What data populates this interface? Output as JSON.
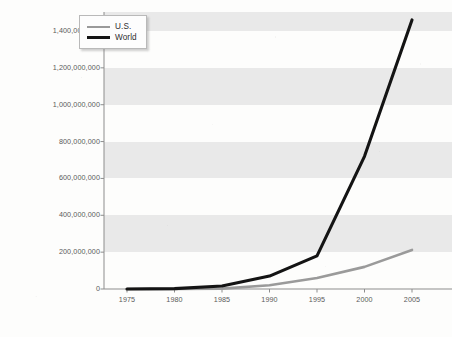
{
  "chart_data": {
    "type": "line",
    "title": "",
    "subtitle": "",
    "xlabel": "",
    "ylabel": "",
    "x": [
      1975,
      1980,
      1985,
      1990,
      1995,
      2000,
      2005
    ],
    "categories": [
      "1975",
      "1980",
      "1985",
      "1990",
      "1995",
      "2000",
      "2005"
    ],
    "xlim": [
      1975,
      2005
    ],
    "ylim": [
      0,
      1400000000
    ],
    "grid": false,
    "banded_background": true,
    "legend_position": "top-left-inside",
    "series": [
      {
        "name": "U.S.",
        "color": "#9a9a9a",
        "values": [
          0,
          0,
          2000000,
          20000000,
          60000000,
          120000000,
          212000000
        ]
      },
      {
        "name": "World",
        "color": "#141414",
        "values": [
          0,
          2000000,
          16000000,
          70000000,
          180000000,
          720000000,
          1460000000
        ]
      }
    ],
    "yticks": [
      0,
      200000000,
      400000000,
      600000000,
      800000000,
      1000000000,
      1200000000,
      1400000000
    ],
    "ytick_labels": [
      "0",
      "200,000,000",
      "400,000,000",
      "600,000,000",
      "800,000,000",
      "1,000,000,000",
      "1,200,000,000",
      "1,400,000,000"
    ],
    "xtick_labels": [
      "1975",
      "1980",
      "1985",
      "1990",
      "1995",
      "2000",
      "2005"
    ]
  },
  "legend": {
    "items": [
      {
        "label": "U.S.",
        "color": "#9a9a9a"
      },
      {
        "label": "World",
        "color": "#141414"
      }
    ]
  },
  "colors": {
    "us_line": "#9a9a9a",
    "world_line": "#141414",
    "band": "#e9e9e9",
    "axis": "#8d8d8d",
    "paper": "#fdfdfc",
    "tick_text": "#5a5a5a"
  }
}
